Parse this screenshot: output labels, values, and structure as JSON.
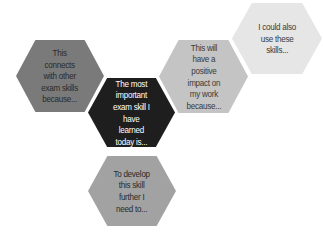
{
  "diagram": {
    "type": "hexagon-cluster",
    "hexagons": [
      {
        "id": "connects",
        "text": "This connects with other exam skills because...",
        "fill": "#7a7a7a",
        "text_color": "#2a2a2a",
        "box": [
          16,
          40,
          88,
          72
        ]
      },
      {
        "id": "center",
        "text": "The most important exam skill I have learned today is...",
        "fill": "#1e1e1e",
        "text_color": "#ffffff",
        "box": [
          88,
          78,
          87,
          69
        ]
      },
      {
        "id": "impact",
        "text": "This will have a positive impact on my work because...",
        "fill": "#c4c4c4",
        "text_color": "#3a3a3a",
        "box": [
          159,
          40,
          89,
          73
        ]
      },
      {
        "id": "also-use",
        "text": "I could also use these skills...",
        "fill": "#e6e6e6",
        "text_color": "#3a3a3a",
        "box": [
          232,
          3,
          90,
          71
        ]
      },
      {
        "id": "develop",
        "text": "To develop this skill further I need to...",
        "fill": "#a2a2a2",
        "text_color": "#2a2a2a",
        "box": [
          88,
          156,
          88,
          70
        ]
      }
    ]
  }
}
